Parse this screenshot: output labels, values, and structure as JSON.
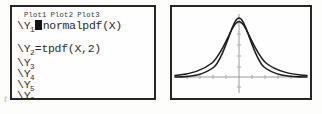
{
  "device": {
    "kind": "graphing-calculator",
    "editor_title": "Y= editor"
  },
  "editor": {
    "plot_tabs": [
      "Plot1",
      "Plot2",
      "Plot3"
    ],
    "functions": [
      {
        "label": "\\Y",
        "subscript": "1",
        "separator": "",
        "expression": "normalpdf(X)",
        "cursor": true
      },
      {
        "label": "\\Y",
        "subscript": "2",
        "separator": "=",
        "expression": "tpdf(X,2)",
        "cursor": false
      },
      {
        "label": "\\Y",
        "subscript": "3",
        "separator": "",
        "expression": "",
        "cursor": false
      },
      {
        "label": "\\Y",
        "subscript": "4",
        "separator": "",
        "expression": "",
        "cursor": false
      },
      {
        "label": "\\Y",
        "subscript": "5",
        "separator": "",
        "expression": "",
        "cursor": false
      },
      {
        "label": "\\Y",
        "subscript": "6",
        "separator": "",
        "expression": "",
        "cursor": false
      }
    ]
  },
  "graph": {
    "axes": {
      "x_axis": true,
      "y_axis": true,
      "ticks": true
    },
    "curves": [
      {
        "name": "normalpdf(X)",
        "role": "standard-normal-density",
        "peak_height": 1.0,
        "tail_weight": "thin",
        "color": "#1c1c1c"
      },
      {
        "name": "tpdf(X,2)",
        "role": "t-density-df-2",
        "peak_height": 0.88,
        "tail_weight": "fat",
        "color": "#1c1c1c"
      }
    ]
  },
  "artifact": {
    "mark": "t"
  },
  "colors": {
    "border": "#262626",
    "screen_bg": "#fefefe",
    "text": "#2b2b2b",
    "cursor": "#141414",
    "axis": "#8a8a8a",
    "curve": "#1c1c1c"
  }
}
